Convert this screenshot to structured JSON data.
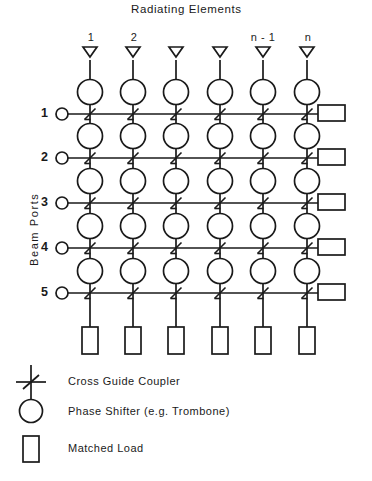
{
  "diagram": {
    "title": "Radiating Elements",
    "vertical_axis_label": "Beam Ports",
    "type": "beam-forming-network-blass-matrix",
    "columns": {
      "count": 6,
      "labels": [
        "1",
        "2",
        "",
        "",
        "n - 1",
        "n"
      ],
      "x_positions": [
        90,
        133,
        176,
        220,
        263,
        307
      ]
    },
    "rows": {
      "count": 5,
      "labels": [
        "1",
        "2",
        "3",
        "4",
        "5"
      ],
      "y_positions": [
        114,
        158,
        203,
        248,
        293
      ]
    },
    "components": {
      "antenna_symbol": "antenna-triangle",
      "phase_shifter_symbol": "circle",
      "coupler_symbol": "cross-guide-coupler",
      "load_symbol": "rectangle"
    },
    "counts": {
      "antennas": 6,
      "phase_shifters": 30,
      "couplers": 30,
      "right_matched_loads": 5,
      "bottom_matched_loads": 6,
      "beam_ports": 5
    },
    "colors": {
      "line": "#1a1a1a",
      "background": "#ffffff",
      "text": "#1a1a1a"
    }
  },
  "legend": {
    "items": [
      {
        "symbol": "cross-guide-coupler",
        "label": "Cross Guide Coupler"
      },
      {
        "symbol": "circle",
        "label": "Phase Shifter (e.g. Trombone)"
      },
      {
        "symbol": "rectangle",
        "label": "Matched Load"
      }
    ]
  }
}
